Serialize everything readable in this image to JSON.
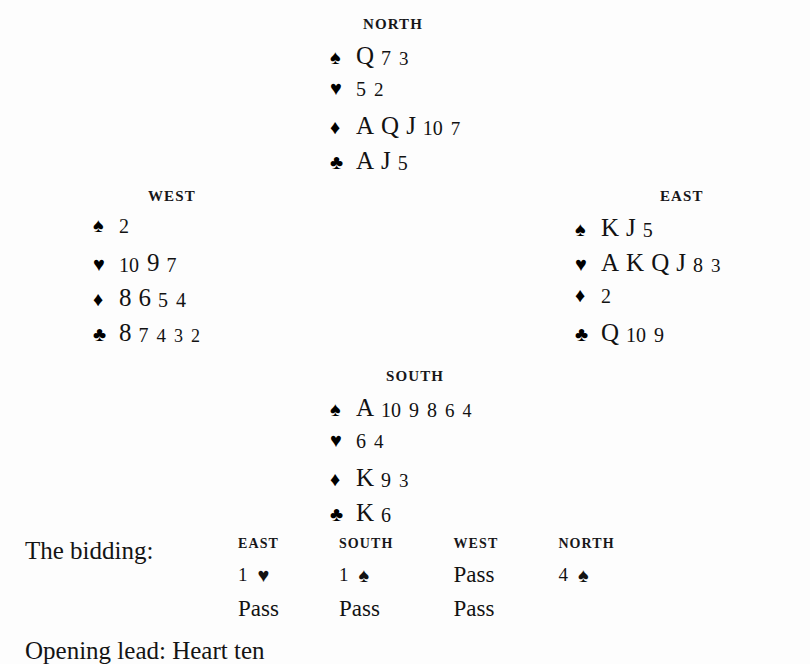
{
  "suits": {
    "spade": "♠",
    "heart": "♥",
    "diamond": "♦",
    "club": "♣"
  },
  "hands": {
    "north": {
      "label": "NORTH",
      "spades": [
        "Q",
        "7",
        "3"
      ],
      "hearts": [
        "5",
        "2"
      ],
      "diamonds": [
        "A",
        "Q",
        "J",
        "10",
        "7"
      ],
      "clubs": [
        "A",
        "J",
        "5"
      ]
    },
    "west": {
      "label": "WEST",
      "spades": [
        "2"
      ],
      "hearts": [
        "10",
        "9",
        "7"
      ],
      "diamonds": [
        "8",
        "6",
        "5",
        "4"
      ],
      "clubs": [
        "8",
        "7",
        "4",
        "3",
        "2"
      ]
    },
    "east": {
      "label": "EAST",
      "spades": [
        "K",
        "J",
        "5"
      ],
      "hearts": [
        "A",
        "K",
        "Q",
        "J",
        "8",
        "3"
      ],
      "diamonds": [
        "2"
      ],
      "clubs": [
        "Q",
        "10",
        "9"
      ]
    },
    "south": {
      "label": "SOUTH",
      "spades": [
        "A",
        "10",
        "9",
        "8",
        "6",
        "4"
      ],
      "hearts": [
        "6",
        "4"
      ],
      "diamonds": [
        "K",
        "9",
        "3"
      ],
      "clubs": [
        "K",
        "6"
      ]
    }
  },
  "bidding": {
    "caption": "The bidding:",
    "columns": [
      "EAST",
      "SOUTH",
      "WEST",
      "NORTH"
    ],
    "rows": [
      [
        {
          "level": "1",
          "suit": "♥"
        },
        {
          "level": "1",
          "suit": "♠"
        },
        {
          "call": "Pass"
        },
        {
          "level": "4",
          "suit": "♠"
        }
      ],
      [
        {
          "call": "Pass"
        },
        {
          "call": "Pass"
        },
        {
          "call": "Pass"
        },
        {
          "call": ""
        }
      ]
    ]
  },
  "trailing_line": "Opening lead: Heart ten"
}
